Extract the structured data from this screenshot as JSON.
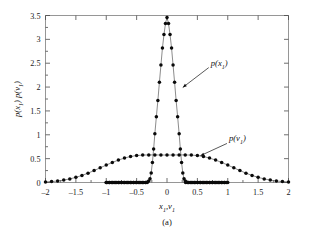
{
  "figure": {
    "caption": "(a)",
    "background_color": "#ffffff"
  },
  "chart_data": {
    "type": "line",
    "title": "",
    "subtitle": "",
    "xlabel": "x₁,v₁",
    "ylabel": "p(x₁) p(v₁)",
    "caption": "(a)",
    "xlim": [
      -2,
      2
    ],
    "ylim": [
      0,
      3.5
    ],
    "grid": false,
    "legend_position": "inline-annotations",
    "xticks": [
      -2,
      -1.5,
      -1,
      -0.5,
      0,
      0.5,
      1,
      1.5,
      2
    ],
    "xtick_labels": [
      "–2",
      "–1.5",
      "–1",
      "–0.5",
      "0",
      "0.5",
      "1",
      "1.5",
      "2"
    ],
    "yticks": [
      0,
      0.5,
      1,
      1.5,
      2,
      2.5,
      3,
      3.5
    ],
    "ytick_labels": [
      "0",
      "0.5",
      "1",
      "1.5",
      "2",
      "2.5",
      "3",
      "3.5"
    ],
    "marker": "filled-circle",
    "line_color": "#5a5a5a",
    "marker_color": "#0a0a0a",
    "annotations": [
      {
        "text": "p(x₁)",
        "target_x": 0.21,
        "target_y": 1.95,
        "label_x": 0.72,
        "label_y": 2.45
      },
      {
        "text": "p(v₁)",
        "target_x": 0.5,
        "target_y": 0.52,
        "label_x": 1.02,
        "label_y": 0.86
      }
    ],
    "series": [
      {
        "name": "p(x₁)",
        "description": "Narrow sharply peaked distribution; near zero outside |x|>0.3, peak 3.46 at x=0",
        "x": [
          -1.0,
          -0.95,
          -0.9,
          -0.85,
          -0.8,
          -0.75,
          -0.7,
          -0.65,
          -0.6,
          -0.55,
          -0.5,
          -0.45,
          -0.4,
          -0.35,
          -0.32,
          -0.3,
          -0.28,
          -0.26,
          -0.24,
          -0.22,
          -0.2,
          -0.175,
          -0.15,
          -0.125,
          -0.1,
          -0.075,
          -0.05,
          -0.025,
          0.0,
          0.025,
          0.05,
          0.075,
          0.1,
          0.125,
          0.15,
          0.175,
          0.2,
          0.22,
          0.24,
          0.26,
          0.28,
          0.3,
          0.32,
          0.35,
          0.4,
          0.45,
          0.5,
          0.55,
          0.6,
          0.65,
          0.7,
          0.75,
          0.8,
          0.85,
          0.9,
          0.95,
          1.0
        ],
        "y": [
          0.0,
          0.0,
          0.0,
          0.0,
          0.0,
          0.0,
          0.0,
          0.0,
          0.0,
          0.0,
          0.0,
          0.0,
          0.0,
          0.0,
          0.01,
          0.03,
          0.08,
          0.2,
          0.42,
          0.7,
          1.02,
          1.38,
          1.72,
          2.1,
          2.46,
          2.82,
          3.1,
          3.33,
          3.46,
          3.33,
          3.1,
          2.82,
          2.46,
          2.1,
          1.72,
          1.38,
          1.02,
          0.7,
          0.42,
          0.2,
          0.08,
          0.03,
          0.01,
          0.0,
          0.0,
          0.0,
          0.0,
          0.0,
          0.0,
          0.0,
          0.0,
          0.0,
          0.0,
          0.0,
          0.0,
          0.0,
          0.0
        ]
      },
      {
        "name": "p(v₁)",
        "description": "Broad bell-shaped distribution spanning -2 to 2, peak 0.575 near x=0",
        "x": [
          -2.0,
          -1.9,
          -1.8,
          -1.7,
          -1.6,
          -1.5,
          -1.4,
          -1.3,
          -1.2,
          -1.1,
          -1.0,
          -0.9,
          -0.8,
          -0.7,
          -0.6,
          -0.5,
          -0.4,
          -0.3,
          -0.2,
          -0.1,
          0.0,
          0.1,
          0.2,
          0.3,
          0.4,
          0.5,
          0.6,
          0.7,
          0.8,
          0.9,
          1.0,
          1.1,
          1.2,
          1.3,
          1.4,
          1.5,
          1.6,
          1.7,
          1.8,
          1.9,
          2.0
        ],
        "y": [
          0.012,
          0.02,
          0.032,
          0.05,
          0.075,
          0.108,
          0.148,
          0.196,
          0.25,
          0.307,
          0.365,
          0.42,
          0.47,
          0.512,
          0.545,
          0.565,
          0.574,
          0.578,
          0.578,
          0.576,
          0.575,
          0.576,
          0.578,
          0.578,
          0.574,
          0.565,
          0.545,
          0.512,
          0.47,
          0.42,
          0.365,
          0.307,
          0.25,
          0.196,
          0.148,
          0.108,
          0.075,
          0.05,
          0.032,
          0.02,
          0.012
        ]
      }
    ]
  }
}
